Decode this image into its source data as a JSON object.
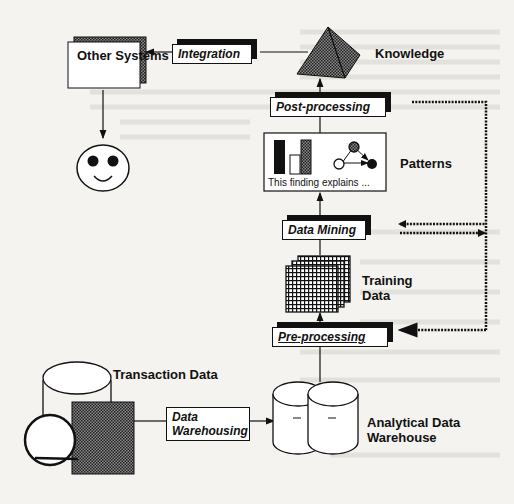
{
  "diagram": {
    "nodes": {
      "other_systems": "Other Systems",
      "knowledge": "Knowledge",
      "patterns": "Patterns",
      "patterns_caption": "This finding explains ...",
      "training_data": "Training Data",
      "training_data_line1": "Training",
      "training_data_line2": "Data",
      "transaction_data": "Transaction Data",
      "analytical_warehouse_line1": "Analytical Data",
      "analytical_warehouse_line2": "Warehouse"
    },
    "processes": {
      "integration": "Integration",
      "post_processing": "Post-processing",
      "data_mining": "Data Mining",
      "pre_processing": "Pre-processing",
      "data_warehousing_line1": "Data",
      "data_warehousing_line2": "Warehousing"
    },
    "icons": {
      "user": "smiley-face-icon",
      "knowledge": "pyramid-icon",
      "patterns": "bar-chart-graph-icon",
      "training": "grid-stack-icon",
      "transaction": "database-disk-icon",
      "warehouse": "double-cylinder-icon"
    },
    "colors": {
      "line": "#111111",
      "background": "#f4f3ef",
      "hatch": "#555555"
    }
  }
}
